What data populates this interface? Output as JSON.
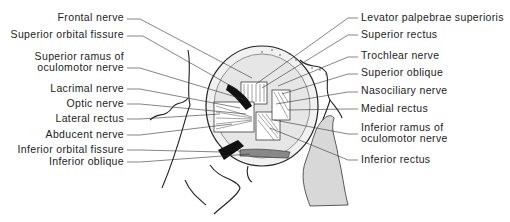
{
  "figure": {
    "left_labels": [
      {
        "text": "Frontal nerve",
        "lines": [
          "Frontal nerve"
        ],
        "y": 12
      },
      {
        "text": "Superior orbital fissure",
        "lines": [
          "Superior orbital fissure"
        ],
        "y": 29
      },
      {
        "text": "Superior ramus of oculomotor nerve",
        "lines": [
          "Superior ramus of",
          "oculomotor nerve"
        ],
        "y": 51
      },
      {
        "text": "Lacrimal nerve",
        "lines": [
          "Lacrimal nerve"
        ],
        "y": 81
      },
      {
        "text": "Optic nerve",
        "lines": [
          "Optic nerve"
        ],
        "y": 96
      },
      {
        "text": "Lateral rectus",
        "lines": [
          "Lateral rectus"
        ],
        "y": 111
      },
      {
        "text": "Abducent nerve",
        "lines": [
          "Abducent nerve"
        ],
        "y": 127
      },
      {
        "text": "Inferior orbital fissure",
        "lines": [
          "Inferior orbital fissure"
        ],
        "y": 142
      },
      {
        "text": "Inferior oblique",
        "lines": [
          "Inferior oblique"
        ],
        "y": 155
      }
    ],
    "right_labels": [
      {
        "text": "Levator palpebrae superioris",
        "lines": [
          "Levator palpebrae superioris"
        ],
        "y": 11
      },
      {
        "text": "Superior rectus",
        "lines": [
          "Superior rectus"
        ],
        "y": 28
      },
      {
        "text": "Trochlear nerve",
        "lines": [
          "Trochlear nerve"
        ],
        "y": 49
      },
      {
        "text": "Superior oblique",
        "lines": [
          "Superior oblique"
        ],
        "y": 66
      },
      {
        "text": "Nasociliary nerve",
        "lines": [
          "Nasociliary nerve"
        ],
        "y": 84
      },
      {
        "text": "Medial rectus",
        "lines": [
          "Medial rectus"
        ],
        "y": 102
      },
      {
        "text": "Inferior ramus of oculomotor nerve",
        "lines": [
          "Inferior ramus of",
          "oculomotor nerve"
        ],
        "y": 120
      },
      {
        "text": "Inferior rectus",
        "lines": [
          "Inferior rectus"
        ],
        "y": 152
      }
    ]
  }
}
